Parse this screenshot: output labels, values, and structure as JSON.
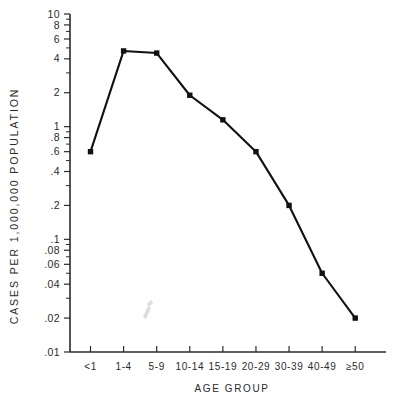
{
  "chart_data": {
    "type": "line",
    "title": "",
    "xlabel": "AGE  GROUP",
    "ylabel": "CASES  PER  1,000,000  POPULATION",
    "categories": [
      "<1",
      "1-4",
      "5-9",
      "10-14",
      "15-19",
      "20-29",
      "30-39",
      "40-49",
      "≥50"
    ],
    "values": [
      0.6,
      4.7,
      4.5,
      1.9,
      1.15,
      0.6,
      0.2,
      0.05,
      0.02
    ],
    "yscale": "log",
    "ylim": [
      0.01,
      10
    ],
    "xlim": [
      0,
      9
    ],
    "grid": false,
    "legend": null,
    "series": [
      {
        "name": "cases per 1,000,000 population",
        "marker": "square",
        "color": "#111111",
        "values": [
          0.6,
          4.7,
          4.5,
          1.9,
          1.15,
          0.6,
          0.2,
          0.05,
          0.02
        ]
      }
    ],
    "ytick_labels": [
      "10",
      "8",
      "6",
      "4",
      "2",
      "1",
      ".8",
      ".6",
      ".4",
      ".2",
      ".1",
      ".08",
      ".06",
      ".04",
      ".02",
      ".01"
    ],
    "ytick_values": [
      10,
      8,
      6,
      4,
      2,
      1,
      0.8,
      0.6,
      0.4,
      0.2,
      0.1,
      0.08,
      0.06,
      0.04,
      0.02,
      0.01
    ],
    "yminor_values": [
      9,
      7,
      5,
      3,
      0.9,
      0.7,
      0.5,
      0.3,
      0.09,
      0.07,
      0.05,
      0.03
    ],
    "xtick_labels": [
      "<1",
      "1-4",
      "5-9",
      "10-14",
      "15-19",
      "20-29",
      "30-39",
      "40-49",
      "≥50"
    ]
  },
  "figure": {
    "background_color": "#ffffff",
    "ink_color": "#111111"
  }
}
